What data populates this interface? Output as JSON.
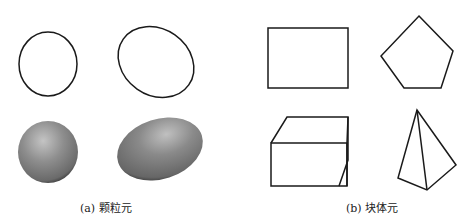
{
  "figure": {
    "panels": [
      {
        "id": "a",
        "caption": "(a) 颗粒元",
        "elements": [
          {
            "name": "circle-outline",
            "type": "ellipse-outline"
          },
          {
            "name": "ellipse-outline",
            "type": "ellipse-outline"
          },
          {
            "name": "sphere-shaded",
            "type": "shaded-sphere"
          },
          {
            "name": "ellipsoid-shaded",
            "type": "shaded-ellipsoid"
          }
        ]
      },
      {
        "id": "b",
        "caption": "(b) 块体元",
        "elements": [
          {
            "name": "rectangle",
            "type": "polygon-2d"
          },
          {
            "name": "pentagon",
            "type": "polygon-2d"
          },
          {
            "name": "cube",
            "type": "polyhedron-3d"
          },
          {
            "name": "tetrahedron",
            "type": "polyhedron-3d"
          }
        ]
      }
    ],
    "colors": {
      "stroke": "#1a1a1a",
      "shade_light": "#bdbdbd",
      "shade_mid": "#8a8a8a",
      "shade_dark": "#2e2e2e",
      "background": "#ffffff"
    }
  }
}
